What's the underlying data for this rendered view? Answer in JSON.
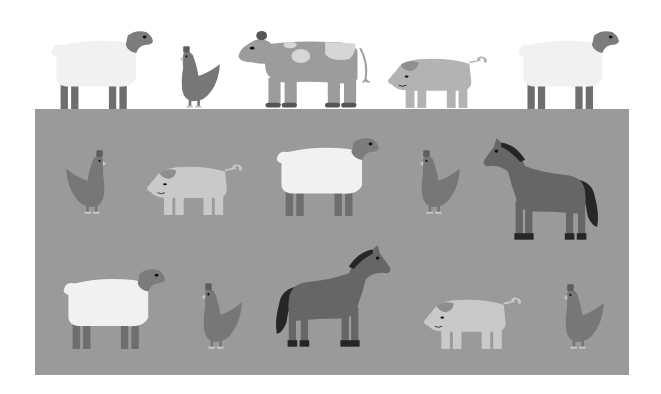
{
  "scene": {
    "title": "Farm animals illustration",
    "background_color": "#ffffff",
    "field": {
      "color": "#9a9a9a",
      "x": 35,
      "y": 109,
      "w": 594,
      "h": 266
    }
  },
  "colors": {
    "sheep_wool": "#f1f1f1",
    "sheep_head": "#7c7c7c",
    "sheep_legs": "#6e6e6e",
    "hen_body": "#777777",
    "hen_comb": "#5e5e5e",
    "hen_feet": "#c8c8c8",
    "cow_body": "#9c9c9c",
    "cow_spots": "#d6d6d6",
    "cow_hooves": "#555555",
    "pig_body_top": "#b3b3b3",
    "pig_body_field": "#c9c9c9",
    "pig_ear": "#8e8e8e",
    "horse_body": "#666666",
    "horse_mane": "#262626",
    "eye": "#111111"
  },
  "animals": [
    {
      "id": "top-sheep-1",
      "type": "sheep",
      "x": 48,
      "y": 29,
      "w": 105,
      "h": 80,
      "flip": false
    },
    {
      "id": "top-hen-1",
      "type": "hen",
      "x": 167,
      "y": 45,
      "w": 54,
      "h": 64,
      "flip": false
    },
    {
      "id": "top-cow",
      "type": "cow",
      "x": 236,
      "y": 31,
      "w": 135,
      "h": 78,
      "flip": false
    },
    {
      "id": "top-pig",
      "type": "pig",
      "x": 389,
      "y": 55,
      "w": 98,
      "h": 54,
      "flip": true
    },
    {
      "id": "top-sheep-2",
      "type": "sheep",
      "x": 515,
      "y": 29,
      "w": 104,
      "h": 80,
      "flip": false
    },
    {
      "id": "mid-hen-1",
      "type": "hen",
      "x": 65,
      "y": 149,
      "w": 54,
      "h": 66,
      "flip": true
    },
    {
      "id": "mid-pig",
      "type": "pig",
      "x": 148,
      "y": 163,
      "w": 94,
      "h": 53,
      "flip": true
    },
    {
      "id": "mid-sheep",
      "type": "sheep",
      "x": 273,
      "y": 136,
      "w": 106,
      "h": 80,
      "flip": false
    },
    {
      "id": "mid-hen-2",
      "type": "hen",
      "x": 407,
      "y": 149,
      "w": 54,
      "h": 66,
      "flip": false
    },
    {
      "id": "mid-horse",
      "type": "horse",
      "x": 482,
      "y": 136,
      "w": 120,
      "h": 108,
      "flip": false
    },
    {
      "id": "bot-sheep",
      "type": "sheep",
      "x": 60,
      "y": 267,
      "w": 105,
      "h": 82,
      "flip": false
    },
    {
      "id": "bot-hen-1",
      "type": "hen",
      "x": 189,
      "y": 282,
      "w": 54,
      "h": 68,
      "flip": false
    },
    {
      "id": "bot-horse",
      "type": "horse",
      "x": 272,
      "y": 243,
      "w": 120,
      "h": 108,
      "flip": true
    },
    {
      "id": "bot-pig",
      "type": "pig",
      "x": 425,
      "y": 296,
      "w": 96,
      "h": 54,
      "flip": true
    },
    {
      "id": "bot-hen-2",
      "type": "hen",
      "x": 551,
      "y": 283,
      "w": 54,
      "h": 67,
      "flip": false
    }
  ]
}
